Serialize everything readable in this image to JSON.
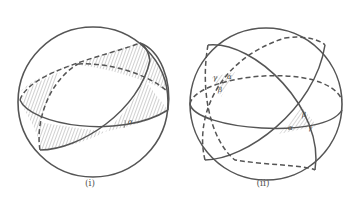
{
  "figures": [
    {
      "id": "i",
      "caption": "(i)",
      "description": "Sphere with two great circles forming a lune (shaded with hatching) and angle alpha",
      "labels": {
        "angle": "α"
      }
    },
    {
      "id": "ii",
      "caption": "(ii)",
      "description": "Sphere with three great circles forming a spherical triangle and its antipodal triangle, both shaded, with angles alpha, beta, gamma",
      "labels": {
        "alpha": "α",
        "beta": "β",
        "gamma": "γ"
      }
    }
  ],
  "colors": {
    "stroke": "#555555",
    "hatch": "#777777",
    "background": "#ffffff"
  }
}
